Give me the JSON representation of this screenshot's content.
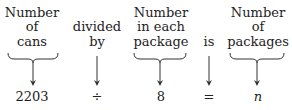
{
  "columns": [
    {
      "lines": [
        "Number",
        "of",
        "cans"
      ],
      "symbol": "2203",
      "brace": true
    },
    {
      "lines": [
        "divided",
        "by"
      ],
      "symbol": "÷",
      "brace": false
    },
    {
      "lines": [
        "Number",
        "in each",
        "package"
      ],
      "symbol": "8",
      "brace": true
    },
    {
      "lines": [
        "is"
      ],
      "symbol": "=",
      "brace": false
    },
    {
      "lines": [
        "Number",
        "of",
        "packages"
      ],
      "symbol": "n",
      "brace": true
    }
  ]
}
